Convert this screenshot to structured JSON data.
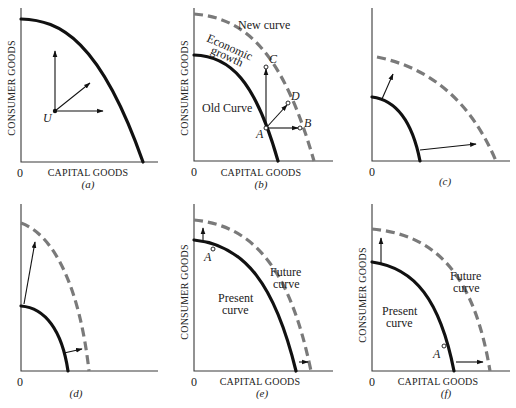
{
  "figure": {
    "panels": [
      {
        "id": "a",
        "caption": "(a)",
        "y_label": "CONSUMER GOODS",
        "x_label": "CAPITAL GOODS",
        "origin_label": "0",
        "point_label": "U",
        "description": "Point U inside frontier with arrows pointing up, diagonally, and right"
      },
      {
        "id": "b",
        "caption": "(b)",
        "y_label": "CONSUMER GOODS",
        "x_label": "CAPITAL GOODS",
        "origin_label": "0",
        "old_curve_label": "Old Curve",
        "new_curve_label": "New curve",
        "growth_label_line1": "Economic",
        "growth_label_line2": "growth",
        "point_labels": [
          "A",
          "B",
          "C",
          "D"
        ]
      },
      {
        "id": "c",
        "caption": "(c)",
        "origin_label": "0",
        "description": "Outward shift favoring capital goods"
      },
      {
        "id": "d",
        "caption": "(d)",
        "origin_label": "0",
        "description": "Outward shift favoring consumer goods"
      },
      {
        "id": "e",
        "caption": "(e)",
        "y_label": "CONSUMER GOODS",
        "x_label": "CAPITAL GOODS",
        "origin_label": "0",
        "present_label_line1": "Present",
        "present_label_line2": "curve",
        "future_label_line1": "Future",
        "future_label_line2": "curve",
        "point_label": "A"
      },
      {
        "id": "f",
        "caption": "(f)",
        "y_label": "CONSUMER GOODS",
        "x_label": "CAPITAL GOODS",
        "origin_label": "0",
        "present_label_line1": "Present",
        "present_label_line2": "curve",
        "future_label_line1": "Future",
        "future_label_line2": "curve",
        "point_label": "A"
      }
    ],
    "colors": {
      "present_curve": "#111111",
      "future_curve": "#7a7a7a",
      "axes": "#3a3a3a"
    }
  }
}
